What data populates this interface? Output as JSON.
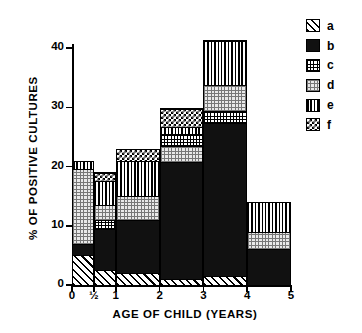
{
  "chart_data": {
    "type": "bar",
    "subtype": "stacked-histogram",
    "title": "",
    "xlabel": "AGE OF CHILD (YEARS)",
    "ylabel": "% OF POSITIVE CULTURES",
    "categories": [
      "0",
      "½",
      "1",
      "2",
      "3",
      "4"
    ],
    "xtick_labels": [
      "0",
      "½",
      "1",
      "2",
      "3",
      "4",
      "5"
    ],
    "ytick_labels": [
      "0",
      "10",
      "20",
      "30",
      "40"
    ],
    "ytick_values": [
      0,
      10,
      20,
      30,
      40
    ],
    "ylim": [
      0,
      44
    ],
    "xlim": [
      0,
      5
    ],
    "grid": false,
    "legend_position": "right",
    "series": [
      {
        "name": "a",
        "pattern": "diagonal-hatch",
        "values": [
          5.0,
          2.5,
          2.0,
          1.0,
          1.5,
          0.0
        ]
      },
      {
        "name": "b",
        "pattern": "solid-black",
        "values": [
          2.0,
          7.0,
          9.0,
          19.8,
          25.8,
          6.0
        ]
      },
      {
        "name": "c",
        "pattern": "fine-grid",
        "values": [
          0.0,
          1.5,
          0.0,
          2.0,
          2.0,
          0.0
        ]
      },
      {
        "name": "d",
        "pattern": "stipple-dots",
        "values": [
          12.5,
          2.5,
          4.0,
          2.7,
          4.5,
          3.0
        ]
      },
      {
        "name": "e",
        "pattern": "vertical-lines",
        "values": [
          1.5,
          4.0,
          6.0,
          1.2,
          7.5,
          5.0
        ]
      },
      {
        "name": "f",
        "pattern": "checkerboard",
        "values": [
          0.0,
          1.5,
          2.0,
          3.1,
          0.0,
          0.0
        ]
      }
    ],
    "totals": [
      21.0,
      19.0,
      23.0,
      29.8,
      41.3,
      14.0
    ],
    "bar_edges": [
      0,
      0.5,
      1,
      2,
      3,
      4,
      5
    ]
  },
  "legend": {
    "items": [
      {
        "label": "a",
        "pattern": "diagonal-hatch"
      },
      {
        "label": "b",
        "pattern": "solid-black"
      },
      {
        "label": "c",
        "pattern": "fine-grid"
      },
      {
        "label": "d",
        "pattern": "stipple-dots"
      },
      {
        "label": "e",
        "pattern": "vertical-lines"
      },
      {
        "label": "f",
        "pattern": "checkerboard"
      }
    ]
  }
}
